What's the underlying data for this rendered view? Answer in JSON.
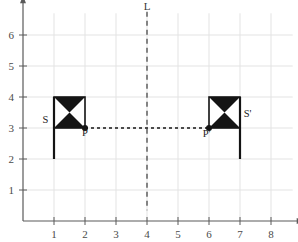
{
  "figure": {
    "background_color": "#ffffff"
  },
  "chart_data": {
    "type": "scatter",
    "title": "",
    "xlabel": "",
    "ylabel": "",
    "xlim": [
      0,
      8.7
    ],
    "ylim": [
      0,
      6.7
    ],
    "grid": true,
    "grid_color": "#e3e3e3",
    "axis_color": "#5a5a5a",
    "x_ticks": [
      1,
      2,
      3,
      4,
      5,
      6,
      7,
      8
    ],
    "x_tick_labels": [
      "1",
      "2",
      "3",
      "4",
      "5",
      "6",
      "7",
      "8"
    ],
    "y_ticks": [
      1,
      2,
      3,
      4,
      5,
      6
    ],
    "y_tick_labels": [
      "1",
      "2",
      "3",
      "4",
      "5",
      "6"
    ],
    "mirror_line": {
      "label": "L",
      "orientation": "vertical",
      "x": 4,
      "y_from": 0.35,
      "y_to": 6.75,
      "style": "dashed",
      "color": "#2b2b2b",
      "label_x": 4,
      "label_y": 6.75
    },
    "shapes": [
      {
        "name": "S",
        "label": "S",
        "label_x": 0.82,
        "label_y": 3.15,
        "pole": {
          "x": 1,
          "y_from": 2,
          "y_to": 4
        },
        "flag": {
          "x_from": 1,
          "x_to": 2,
          "y_from": 3,
          "y_to": 4
        },
        "fill_pattern": "bowtie",
        "fill_color": "#141414"
      },
      {
        "name": "S'",
        "label": "S'",
        "label_x": 7.12,
        "label_y": 3.35,
        "pole": {
          "x": 7,
          "y_from": 2,
          "y_to": 4
        },
        "flag": {
          "x_from": 6,
          "x_to": 7,
          "y_from": 3,
          "y_to": 4
        },
        "fill_pattern": "bowtie",
        "fill_color": "#141414"
      }
    ],
    "points": [
      {
        "label": "P",
        "x": 2,
        "y": 3,
        "label_x": 2.0,
        "label_y": 2.75,
        "color": "#141414"
      },
      {
        "label": "P'",
        "x": 6,
        "y": 3,
        "label_x": 5.92,
        "label_y": 2.72,
        "color": "#141414"
      }
    ],
    "connector": {
      "from_label": "P",
      "to_label": "P'",
      "x_from": 2,
      "x_to": 6,
      "y": 3,
      "style": "dotted",
      "color": "#141414"
    }
  }
}
